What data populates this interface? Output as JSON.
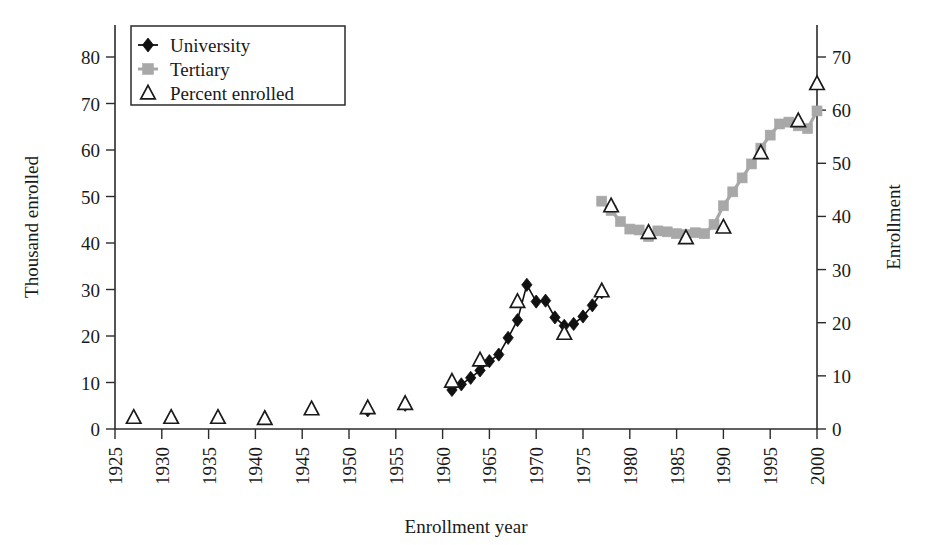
{
  "chart_data": {
    "type": "line",
    "title": "",
    "xlabel": "Enrollment year",
    "ylabel": "Thousand enrolled",
    "y2label": "Enrollment",
    "xlim": [
      1925,
      2000
    ],
    "ylim": [
      0,
      80
    ],
    "y2lim": [
      0,
      70
    ],
    "xticks": [
      1925,
      1930,
      1935,
      1940,
      1945,
      1950,
      1955,
      1960,
      1965,
      1970,
      1975,
      1980,
      1985,
      1990,
      1995,
      2000
    ],
    "xticklabels": [
      "1925",
      "1930",
      "1935",
      "1940",
      "1945",
      "1950",
      "1955",
      "1960",
      "1965",
      "1970",
      "1975",
      "1980",
      "1985",
      "1990",
      "1995",
      "2000"
    ],
    "yticks": [
      0,
      10,
      20,
      30,
      40,
      50,
      60,
      70,
      80
    ],
    "yticklabels": [
      "0",
      "10",
      "20",
      "30",
      "40",
      "50",
      "60",
      "70",
      "80"
    ],
    "y2ticks": [
      0,
      10,
      20,
      30,
      40,
      50,
      60,
      70
    ],
    "y2ticklabels": [
      "0",
      "10",
      "20",
      "30",
      "40",
      "50",
      "60",
      "70"
    ],
    "grid": false,
    "legend_position": "upper-left",
    "series": [
      {
        "name": "University",
        "marker": "filled-diamond",
        "color": "#111111",
        "axis": "left",
        "x": [
          1952,
          1956,
          1961,
          1962,
          1963,
          1964,
          1965,
          1966,
          1967,
          1968,
          1969,
          1970,
          1971,
          1972,
          1973,
          1974,
          1975,
          1976,
          1977
        ],
        "values": [
          4.0,
          5.2,
          8.4,
          9.6,
          11.0,
          12.6,
          14.6,
          16.0,
          19.6,
          23.4,
          31.0,
          27.4,
          27.6,
          24.0,
          22.2,
          22.6,
          24.2,
          26.6,
          29.4
        ]
      },
      {
        "name": "Tertiary",
        "marker": "filled-square",
        "color": "#a8a8a8",
        "axis": "left",
        "x": [
          1977,
          1978,
          1979,
          1980,
          1981,
          1982,
          1983,
          1984,
          1985,
          1986,
          1987,
          1988,
          1989,
          1990,
          1991,
          1992,
          1993,
          1994,
          1995,
          1996,
          1997,
          1998,
          1999,
          2000
        ],
        "values": [
          49.0,
          47.0,
          44.6,
          43.0,
          42.8,
          41.4,
          42.6,
          42.4,
          42.0,
          41.8,
          42.2,
          42.0,
          44.0,
          48.0,
          51.0,
          54.0,
          57.0,
          60.4,
          63.2,
          65.6,
          66.0,
          65.2,
          64.6,
          68.4
        ]
      },
      {
        "name": "Percent enrolled",
        "marker": "open-triangle",
        "color": "#1a1a1a",
        "axis": "right",
        "x": [
          1927,
          1931,
          1936,
          1941,
          1946,
          1952,
          1956,
          1961,
          1964,
          1968,
          1973,
          1977,
          1978,
          1982,
          1986,
          1990,
          1994,
          1998,
          2000
        ],
        "values": [
          2.2,
          2.2,
          2.2,
          2.0,
          3.8,
          4.0,
          4.8,
          9.0,
          13.0,
          24.0,
          18.0,
          26.0,
          42.0,
          37.0,
          36.0,
          38.0,
          52.0,
          58.0,
          65.0
        ]
      }
    ]
  },
  "legend": {
    "items": [
      {
        "label": "University",
        "marker": "filled-diamond"
      },
      {
        "label": "Tertiary",
        "marker": "filled-square"
      },
      {
        "label": "Percent enrolled",
        "marker": "open-triangle"
      }
    ]
  },
  "axes": {
    "left_title": "Thousand enrolled",
    "right_title": "Enrollment",
    "bottom_title": "Enrollment year"
  }
}
